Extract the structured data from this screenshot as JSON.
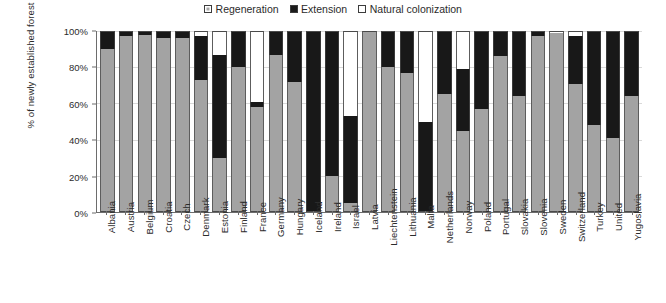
{
  "legend": {
    "position": "top-center",
    "items": [
      {
        "label": "Regeneration",
        "swatch": "regeneration-swatch-icon",
        "color": "#a3a3a3"
      },
      {
        "label": "Extension",
        "swatch": "extension-swatch-icon",
        "color": "#181818"
      },
      {
        "label": "Natural colonization",
        "swatch": "natural-colonization-swatch-icon",
        "color": "#ffffff"
      }
    ]
  },
  "axes": {
    "y_title": "% of newly established forest",
    "y_ticks": [
      "0%",
      "20%",
      "40%",
      "60%",
      "80%",
      "100%"
    ]
  },
  "chart_data": {
    "type": "bar",
    "title": "",
    "xlabel": "",
    "ylabel": "% of newly established forest",
    "ylim": [
      0,
      100
    ],
    "stacked": true,
    "grid": true,
    "legend_position": "top-center",
    "categories": [
      "Albania",
      "Austria",
      "Belgium",
      "Croatia",
      "Czech",
      "Denmark",
      "Estonia",
      "Finland",
      "France",
      "Germany",
      "Hungary",
      "Iceland",
      "Ireland",
      "Israel",
      "Latvia",
      "Liechtenstein",
      "Lithuania",
      "Malta",
      "Netherlands",
      "Norway",
      "Poland",
      "Portugal",
      "Slovakia",
      "Slovenia",
      "Sweden",
      "Switzerland",
      "Turkey",
      "United",
      "Yugoslavia"
    ],
    "series": [
      {
        "name": "Regeneration",
        "color": "#a3a3a3",
        "values": [
          90,
          97,
          98,
          96,
          96,
          73,
          30,
          80,
          58,
          87,
          72,
          0,
          20,
          5,
          100,
          80,
          77,
          0,
          65,
          45,
          57,
          86,
          64,
          97,
          99,
          71,
          48,
          41,
          64
        ]
      },
      {
        "name": "Extension",
        "color": "#181818",
        "values": [
          10,
          3,
          2,
          4,
          4,
          24,
          57,
          20,
          3,
          13,
          28,
          100,
          80,
          48,
          0,
          20,
          23,
          50,
          35,
          34,
          43,
          14,
          36,
          3,
          0,
          26,
          52,
          59,
          36
        ]
      },
      {
        "name": "Natural colonization",
        "color": "#ffffff",
        "values": [
          0,
          0,
          0,
          0,
          0,
          3,
          13,
          0,
          39,
          0,
          0,
          0,
          0,
          47,
          0,
          0,
          0,
          50,
          0,
          21,
          0,
          0,
          0,
          0,
          1,
          3,
          0,
          0,
          0
        ]
      }
    ]
  }
}
